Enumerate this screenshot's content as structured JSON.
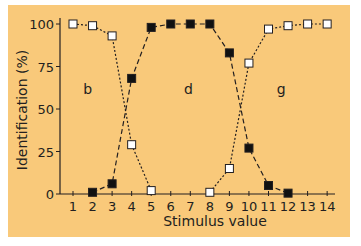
{
  "chart_data": {
    "type": "line",
    "title": "",
    "xlabel": "Stimulus value",
    "ylabel": "Identification (%)",
    "xlim": [
      0.5,
      14.5
    ],
    "ylim": [
      0,
      100
    ],
    "x_ticks": [
      1,
      2,
      3,
      4,
      5,
      6,
      7,
      8,
      9,
      10,
      11,
      12,
      13,
      14
    ],
    "y_ticks": [
      0,
      25,
      50,
      75,
      100
    ],
    "grid": false,
    "legend": null,
    "background_color": "#f9c97a",
    "region_labels": [
      {
        "text": "b",
        "x": 1.75,
        "y": 59
      },
      {
        "text": "d",
        "x": 6.9,
        "y": 59
      },
      {
        "text": "g",
        "x": 11.65,
        "y": 59
      }
    ],
    "series": [
      {
        "name": "b",
        "marker": "open-square",
        "line_style": "dotted",
        "x": [
          1,
          2,
          3,
          4,
          5
        ],
        "y": [
          100,
          99,
          93,
          29,
          2
        ]
      },
      {
        "name": "d",
        "marker": "filled-square",
        "line_style": "dashed",
        "x": [
          2,
          3,
          4,
          5,
          6,
          7,
          8,
          9,
          10,
          11,
          12
        ],
        "y": [
          1,
          6,
          68,
          98,
          100,
          100,
          100,
          83,
          27,
          5,
          0.5
        ]
      },
      {
        "name": "g",
        "marker": "open-square",
        "line_style": "dotted",
        "x": [
          8,
          9,
          10,
          11,
          12,
          13,
          14
        ],
        "y": [
          1,
          15,
          77,
          97,
          99,
          100,
          100
        ]
      }
    ]
  }
}
